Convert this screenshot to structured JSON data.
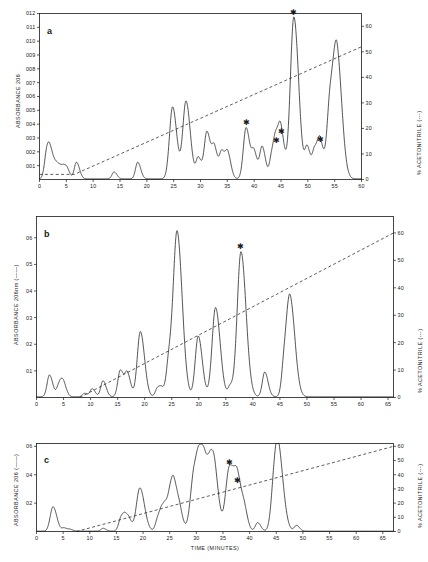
{
  "figure": {
    "background_color": "#ffffff",
    "ink_color": "#1a1a1a",
    "xlabel": "TIME (MINUTES)"
  },
  "chart_data": [
    {
      "type": "line",
      "panel_label": "a",
      "title": "",
      "xlabel": "",
      "ylabel": "ABSORBANCE 206",
      "y2label": "% ACETONITRILE (---)",
      "xlim": [
        0,
        60
      ],
      "ylim": [
        0,
        0.012
      ],
      "y2lim": [
        0,
        65
      ],
      "grid": false,
      "xticks": [
        0,
        5,
        10,
        15,
        20,
        25,
        30,
        35,
        40,
        45,
        50,
        55,
        60
      ],
      "xticklabels": [
        "0",
        "5",
        "10",
        "15",
        "20",
        "25",
        "30",
        "35",
        "40",
        "45",
        "50",
        "55",
        "60"
      ],
      "yticks": [
        0.001,
        0.002,
        0.003,
        0.004,
        0.005,
        0.006,
        0.007,
        0.008,
        0.009,
        0.01,
        0.011,
        0.012
      ],
      "yticklabels": [
        "001",
        "002",
        "003",
        "004",
        "005",
        "006",
        "007",
        "008",
        "009",
        "010",
        "011",
        "012"
      ],
      "y2ticks": [
        0,
        10,
        20,
        30,
        40,
        50,
        60
      ],
      "y2ticklabels": [
        "0",
        "10",
        "20",
        "30",
        "40",
        "50",
        "60"
      ],
      "series": [
        {
          "name": "absorbance",
          "style": "solid",
          "peaks": [
            {
              "x": 1.4,
              "y": 0.002
            },
            {
              "x": 1.9,
              "y": 0.0009
            },
            {
              "x": 2.4,
              "y": 0.0006
            },
            {
              "x": 2.9,
              "y": 0.0005
            },
            {
              "x": 3.4,
              "y": 0.0006
            },
            {
              "x": 4.0,
              "y": 0.0005
            },
            {
              "x": 4.6,
              "y": 0.0006
            },
            {
              "x": 5.2,
              "y": 0.0005
            },
            {
              "x": 6.9,
              "y": 0.0012
            },
            {
              "x": 13.9,
              "y": 0.0005
            },
            {
              "x": 18.3,
              "y": 0.0012
            },
            {
              "x": 24.8,
              "y": 0.0052
            },
            {
              "x": 27.3,
              "y": 0.0056
            },
            {
              "x": 29.6,
              "y": 0.0015
            },
            {
              "x": 31.2,
              "y": 0.0034
            },
            {
              "x": 32.6,
              "y": 0.0021
            },
            {
              "x": 34.0,
              "y": 0.0019
            },
            {
              "x": 35.1,
              "y": 0.0017
            },
            {
              "x": 38.5,
              "y": 0.0037
            },
            {
              "x": 40.0,
              "y": 0.0018
            },
            {
              "x": 41.5,
              "y": 0.0023
            },
            {
              "x": 43.3,
              "y": 0.0016
            },
            {
              "x": 44.1,
              "y": 0.0024
            },
            {
              "x": 45.0,
              "y": 0.0031
            },
            {
              "x": 47.4,
              "y": 0.0117
            },
            {
              "x": 49.9,
              "y": 0.0022
            },
            {
              "x": 51.3,
              "y": 0.002
            },
            {
              "x": 52.3,
              "y": 0.0025
            },
            {
              "x": 54.2,
              "y": 0.0058
            },
            {
              "x": 55.5,
              "y": 0.0081
            }
          ],
          "starred_peaks": [
            38.5,
            44.1,
            45.0,
            47.4,
            52.3
          ]
        },
        {
          "name": "% acetonitrile gradient",
          "style": "dashed",
          "points": [
            [
              0,
              2
            ],
            [
              6.5,
              2
            ],
            [
              60,
              52
            ]
          ]
        }
      ]
    },
    {
      "type": "line",
      "panel_label": "b",
      "title": "",
      "xlabel": "",
      "ylabel": "ABSORBANCE 206nm (——)",
      "y2label": "% ACETONITRILE (---)",
      "xlim": [
        0,
        66
      ],
      "ylim": [
        0,
        0.68
      ],
      "y2lim": [
        0,
        66
      ],
      "grid": false,
      "xticks": [
        0,
        5,
        10,
        15,
        20,
        25,
        30,
        35,
        40,
        45,
        50,
        55,
        60,
        65
      ],
      "xticklabels": [
        "0",
        "5",
        "10",
        "15",
        "20",
        "25",
        "30",
        "35",
        "40",
        "45",
        "50",
        "55",
        "60",
        "65"
      ],
      "yticks": [
        0.1,
        0.2,
        0.3,
        0.4,
        0.5,
        0.6
      ],
      "yticklabels": [
        "01",
        "02",
        "03",
        "04",
        "05",
        "06"
      ],
      "y2ticks": [
        0,
        10,
        20,
        30,
        40,
        50,
        60
      ],
      "y2ticklabels": [
        "0",
        "10",
        "20",
        "30",
        "40",
        "50",
        "60"
      ],
      "series": [
        {
          "name": "absorbance",
          "style": "solid",
          "peaks": [
            {
              "x": 2.4,
              "y": 0.082
            },
            {
              "x": 4.1,
              "y": 0.035
            },
            {
              "x": 4.6,
              "y": 0.033
            },
            {
              "x": 5.1,
              "y": 0.03
            },
            {
              "x": 8.9,
              "y": 0.013
            },
            {
              "x": 10.3,
              "y": 0.03
            },
            {
              "x": 12.3,
              "y": 0.06
            },
            {
              "x": 15.5,
              "y": 0.1
            },
            {
              "x": 16.8,
              "y": 0.085
            },
            {
              "x": 19.2,
              "y": 0.245
            },
            {
              "x": 22.4,
              "y": 0.034
            },
            {
              "x": 23.2,
              "y": 0.025
            },
            {
              "x": 24.5,
              "y": 0.13
            },
            {
              "x": 26.0,
              "y": 0.615
            },
            {
              "x": 29.9,
              "y": 0.228
            },
            {
              "x": 33.1,
              "y": 0.335
            },
            {
              "x": 35.8,
              "y": 0.037
            },
            {
              "x": 37.8,
              "y": 0.545
            },
            {
              "x": 42.2,
              "y": 0.093
            },
            {
              "x": 45.8,
              "y": 0.11
            },
            {
              "x": 46.9,
              "y": 0.36
            }
          ],
          "starred_peaks": [
            37.8
          ]
        },
        {
          "name": "% acetonitrile gradient",
          "style": "dashed",
          "points": [
            [
              8.0,
              0
            ],
            [
              66,
              60
            ]
          ]
        }
      ]
    },
    {
      "type": "line",
      "panel_label": "c",
      "title": "",
      "xlabel": "TIME (MINUTES)",
      "ylabel": "ABSORBANCE 206 (——)",
      "y2label": "% ACETONITRILE (---)",
      "xlim": [
        0,
        67
      ],
      "ylim": [
        0,
        0.62
      ],
      "y2lim": [
        0,
        62
      ],
      "grid": false,
      "xticks": [
        0,
        5,
        10,
        15,
        20,
        25,
        30,
        35,
        40,
        45,
        50,
        55,
        60,
        65
      ],
      "xticklabels": [
        "0",
        "5",
        "10",
        "15",
        "20",
        "25",
        "30",
        "35",
        "40",
        "45",
        "50",
        "55",
        "60",
        "65"
      ],
      "yticks": [
        0.2,
        0.4,
        0.6
      ],
      "yticklabels": [
        "02",
        "04",
        "06"
      ],
      "y2ticks": [
        0,
        10,
        20,
        30,
        40,
        50,
        60
      ],
      "y2ticklabels": [
        "0",
        "10",
        "20",
        "30",
        "40",
        "50",
        "60"
      ],
      "series": [
        {
          "name": "absorbance",
          "style": "solid",
          "peaks": [
            {
              "x": 3.1,
              "y": 0.172
            },
            {
              "x": 5.2,
              "y": 0.022
            },
            {
              "x": 6.3,
              "y": 0.012
            },
            {
              "x": 12.5,
              "y": 0.02
            },
            {
              "x": 15.9,
              "y": 0.095
            },
            {
              "x": 16.7,
              "y": 0.075
            },
            {
              "x": 17.4,
              "y": 0.055
            },
            {
              "x": 19.4,
              "y": 0.305
            },
            {
              "x": 22.8,
              "y": 0.085
            },
            {
              "x": 23.6,
              "y": 0.115
            },
            {
              "x": 24.3,
              "y": 0.11
            },
            {
              "x": 25.1,
              "y": 0.1
            },
            {
              "x": 25.8,
              "y": 0.32
            },
            {
              "x": 27.0,
              "y": 0.055
            },
            {
              "x": 29.6,
              "y": 0.405
            },
            {
              "x": 30.6,
              "y": 0.25
            },
            {
              "x": 31.6,
              "y": 0.37
            },
            {
              "x": 32.8,
              "y": 0.285
            },
            {
              "x": 33.5,
              "y": 0.245
            },
            {
              "x": 36.2,
              "y": 0.445
            },
            {
              "x": 37.8,
              "y": 0.32
            },
            {
              "x": 39.1,
              "y": 0.085
            },
            {
              "x": 41.5,
              "y": 0.06
            },
            {
              "x": 44.6,
              "y": 0.235
            },
            {
              "x": 45.4,
              "y": 0.505
            },
            {
              "x": 48.8,
              "y": 0.04
            }
          ],
          "starred_peaks": [
            36.2,
            37.8
          ]
        },
        {
          "name": "% acetonitrile gradient",
          "style": "dashed",
          "points": [
            [
              7.5,
              0
            ],
            [
              67,
              60
            ]
          ]
        }
      ]
    }
  ]
}
